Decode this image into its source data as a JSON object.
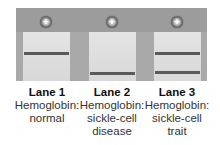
{
  "diagram": {
    "type": "gel-electrophoresis",
    "electrode_symbol": "+",
    "colors": {
      "frame": "#a9a9a9",
      "well_bar": "#9c9c9c",
      "lane_fill": "#dedede",
      "band": "#5a5a5a"
    },
    "lanes": [
      {
        "title": "Lane 1",
        "line1": "Hemoglobin:",
        "line2": "normal",
        "line3": "",
        "bands": [
          "upper"
        ]
      },
      {
        "title": "Lane 2",
        "line1": "Hemoglobin:",
        "line2": "sickle-cell",
        "line3": "disease",
        "bands": [
          "lower"
        ]
      },
      {
        "title": "Lane 3",
        "line1": "Hemoglobin:",
        "line2": "sickle-cell",
        "line3": "trait",
        "bands": [
          "upper",
          "lower"
        ]
      }
    ]
  }
}
